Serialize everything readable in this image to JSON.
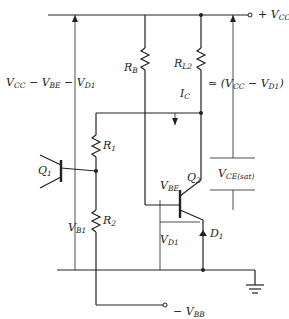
{
  "diagram": {
    "type": "circuit-schematic",
    "components": {
      "Q1": {
        "label": "Q",
        "sub": "1"
      },
      "Q2": {
        "label": "Q",
        "sub": "2"
      },
      "RB": {
        "label": "R",
        "sub": "B"
      },
      "RL2": {
        "label": "R",
        "sub": "L2"
      },
      "R1": {
        "label": "R",
        "sub": "1"
      },
      "R2": {
        "label": "R",
        "sub": "2"
      },
      "D1": {
        "label": "D",
        "sub": "1"
      }
    },
    "terminals": {
      "vcc": {
        "label": "+ V",
        "sub": "CC"
      },
      "vbb": {
        "label": "− V",
        "sub": "BB"
      }
    },
    "annotations": {
      "left_span": {
        "p1": "V",
        "s1": "CC",
        "p2": " − V",
        "s2": "BE",
        "p3": " − V",
        "s3": "D1"
      },
      "right_span": {
        "p1": "≃ (V",
        "s1": "CC",
        "p2": " − V",
        "s2": "D1",
        "p3": ")"
      },
      "ic": {
        "label": "I",
        "sub": "C"
      },
      "vce_sat": {
        "label": "V",
        "sub": "CE(sat)"
      },
      "vbe": {
        "label": "V",
        "sub": "BE"
      },
      "vd1": {
        "label": "V",
        "sub": "D1"
      },
      "vb1": {
        "label": "V",
        "sub": "B1"
      }
    }
  }
}
